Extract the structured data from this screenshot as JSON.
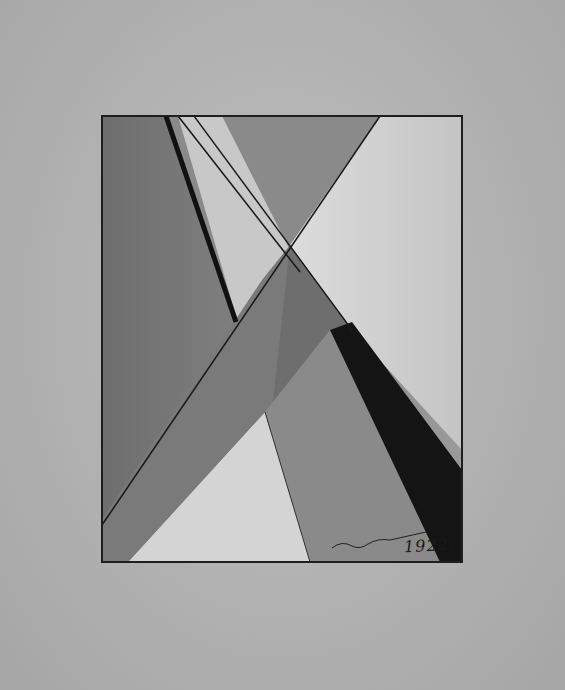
{
  "artwork": {
    "kind": "abstract geometric drawing",
    "palette": {
      "paper": "#b4b4b4",
      "frame_bg": "#8e8e8e",
      "light": "#d8d8d8",
      "mid": "#7c7c7c",
      "dark_band": "#141414",
      "border": "#1e1e1e"
    },
    "inscription": {
      "date": "1922."
    }
  }
}
